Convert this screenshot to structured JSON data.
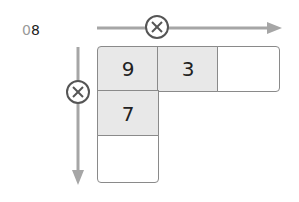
{
  "problem": {
    "number_prefix": "0",
    "number_suffix": "8"
  },
  "operator_symbol": "×",
  "grid": {
    "top_row": [
      "9",
      "3",
      ""
    ],
    "left_column": [
      "9",
      "7",
      ""
    ]
  },
  "colors": {
    "arrow": "#a6a6a6",
    "cell_shaded": "#e8e8e8",
    "cell_border": "#8a8a8a",
    "circle": "#555555"
  }
}
